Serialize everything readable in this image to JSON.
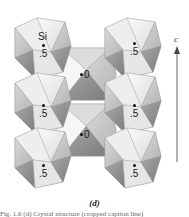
{
  "figure": {
    "panel_label": "(d)",
    "axis": {
      "label": "c",
      "direction": "up"
    },
    "octahedra": [
      {
        "id": "left-top",
        "column": "left",
        "cx": 43,
        "cy": 48,
        "labels": [
          "Si",
          ".5"
        ]
      },
      {
        "id": "left-mid",
        "column": "left",
        "cx": 43,
        "cy": 103,
        "labels": [
          ".5"
        ]
      },
      {
        "id": "left-bot",
        "column": "left",
        "cx": 43,
        "cy": 158,
        "labels": [
          ".5"
        ]
      },
      {
        "id": "mid-top",
        "column": "middle",
        "cx": 86,
        "cy": 74,
        "labels": [
          "0"
        ]
      },
      {
        "id": "mid-bot",
        "column": "middle",
        "cx": 86,
        "cy": 130,
        "labels": [
          "0"
        ]
      },
      {
        "id": "right-top",
        "column": "right",
        "cx": 133,
        "cy": 48,
        "labels": [
          ".5"
        ]
      },
      {
        "id": "right-mid",
        "column": "right",
        "cx": 133,
        "cy": 103,
        "labels": [
          ".5"
        ]
      },
      {
        "id": "right-bot",
        "column": "right",
        "cx": 133,
        "cy": 158,
        "labels": [
          ".5"
        ]
      }
    ],
    "text": {
      "si": "Si",
      "half": ".5",
      "zero": "0"
    },
    "truncated_caption": "Fig. 1.6 (d) Crystal structure (cropped caption line)"
  },
  "colors": {
    "light_face": "#f2f2f2",
    "mid_face": "#cfcfcf",
    "dark_face": "#8f8f8f",
    "edge": "#9a9a9a",
    "text": "#1a1a1a"
  }
}
